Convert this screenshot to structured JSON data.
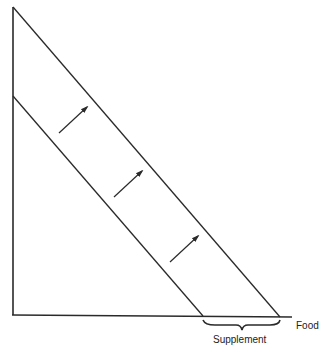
{
  "diagram": {
    "type": "budget-line-shift",
    "x_axis_label": "Food",
    "brace_label": "Supplement",
    "colors": {
      "line": "#2a2a2a",
      "background": "#ffffff"
    },
    "arrows_count": 3
  }
}
